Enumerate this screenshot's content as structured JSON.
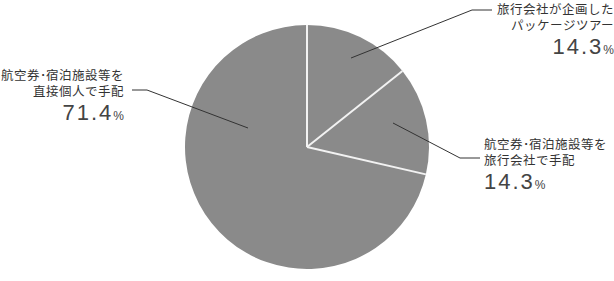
{
  "chart_data": {
    "type": "pie",
    "title": "",
    "start_angle_deg": 0,
    "direction": "clockwise",
    "slice_color": "#8a8a8a",
    "separator_color": "#f2f2f2",
    "slices": [
      {
        "label": "旅行会社が企画したパッケージツアー",
        "label_lines": [
          "旅行会社が企画した",
          "パッケージツアー"
        ],
        "value": 14.3,
        "display": "14.3",
        "unit": "%"
      },
      {
        "label": "航空券・宿泊施設等を旅行会社で手配",
        "label_lines": [
          "航空券･宿泊施設等を",
          "旅行会社で手配"
        ],
        "value": 14.3,
        "display": "14.3",
        "unit": "%"
      },
      {
        "label": "航空券・宿泊施設等を直接個人で手配",
        "label_lines": [
          "航空券･宿泊施設等を",
          "直接個人で手配"
        ],
        "value": 71.4,
        "display": "71.4",
        "unit": "%"
      }
    ],
    "center": [
      307,
      147
    ],
    "radius": 122
  }
}
